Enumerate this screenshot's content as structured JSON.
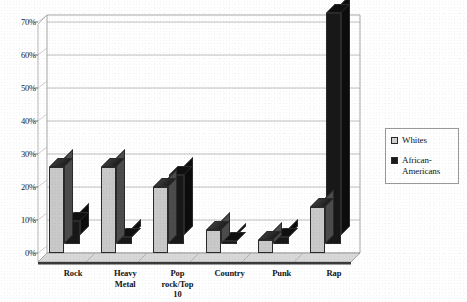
{
  "chart_data": {
    "type": "bar",
    "title": "",
    "subtitle": "",
    "xlabel": "",
    "ylabel": "",
    "categories": [
      "Rock",
      "Heavy\nMetal",
      "Pop\nrock/Top\n10",
      "Country",
      "Punk",
      "Rap"
    ],
    "series": [
      {
        "name": "Whites",
        "values": [
          26,
          26,
          20,
          7,
          4,
          14
        ],
        "color": "#c9c9c9"
      },
      {
        "name": "African-\nAmericans",
        "values": [
          7,
          2,
          21,
          1,
          2,
          70
        ],
        "color": "#181818"
      }
    ],
    "ylim": [
      0,
      70
    ],
    "yticks": [
      0,
      10,
      20,
      30,
      40,
      50,
      60,
      70
    ],
    "ytick_labels": [
      "0%",
      "10%",
      "20%",
      "30%",
      "40%",
      "50%",
      "60%",
      "70%"
    ],
    "grid": true,
    "grid_axis": "y",
    "legend_position": "right",
    "value_format": "percent",
    "three_d": true
  },
  "legend": {
    "entries": [
      {
        "label": "Whites",
        "swatch": "light-dotted-square"
      },
      {
        "label": "African-\nAmericans",
        "swatch": "dark-filled-square"
      }
    ]
  },
  "colors": {
    "series_light": "#c9c9c9",
    "series_dark": "#181818",
    "gridline": "#9c9c9c",
    "axis": "#6f6f6f",
    "text": "#131313",
    "background": "#ffffff"
  }
}
